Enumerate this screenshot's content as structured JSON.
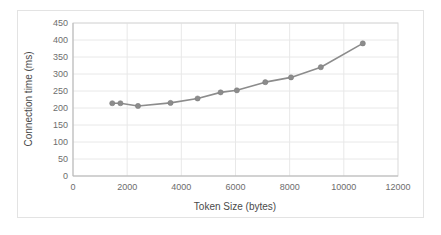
{
  "chart_data": {
    "type": "line",
    "title": "",
    "subtitle": "",
    "xlabel": "Token Size (bytes)",
    "ylabel": "Connection time (ms)",
    "xlim": [
      0,
      12000
    ],
    "ylim": [
      0,
      450
    ],
    "xticks": [
      0,
      2000,
      4000,
      6000,
      8000,
      10000,
      12000
    ],
    "yticks": [
      0,
      50,
      100,
      150,
      200,
      250,
      300,
      350,
      400,
      450
    ],
    "xtick_labels": [
      "0",
      "2000",
      "4000",
      "6000",
      "8000",
      "10000",
      "12000"
    ],
    "ytick_labels": [
      "0",
      "50",
      "100",
      "150",
      "200",
      "250",
      "300",
      "350",
      "400",
      "450"
    ],
    "grid": "horizontal-and-vertical",
    "legend": "none",
    "series": [
      {
        "name": "Connection time",
        "color": "#8c8c8c",
        "marker": "circle",
        "x": [
          1450,
          1750,
          2400,
          3600,
          4600,
          5450,
          6050,
          7100,
          8050,
          9150,
          10700
        ],
        "y": [
          214,
          214,
          206,
          215,
          228,
          246,
          252,
          276,
          290,
          320,
          390
        ]
      }
    ],
    "points": [
      {
        "x": 1450,
        "y": 214
      },
      {
        "x": 1750,
        "y": 214
      },
      {
        "x": 2400,
        "y": 206
      },
      {
        "x": 3600,
        "y": 215
      },
      {
        "x": 4600,
        "y": 228
      },
      {
        "x": 5450,
        "y": 246
      },
      {
        "x": 6050,
        "y": 252
      },
      {
        "x": 7100,
        "y": 276
      },
      {
        "x": 8050,
        "y": 290
      },
      {
        "x": 9150,
        "y": 320
      },
      {
        "x": 10700,
        "y": 390
      }
    ]
  },
  "colors": {
    "series": "#8c8c8c",
    "grid": "#e8e8e8",
    "plot_border": "#d9d9d9",
    "frame_border": "#e3e3e3",
    "tick_text": "#6d6d6d",
    "axis_title": "#4a4a4a",
    "background": "#ffffff"
  }
}
